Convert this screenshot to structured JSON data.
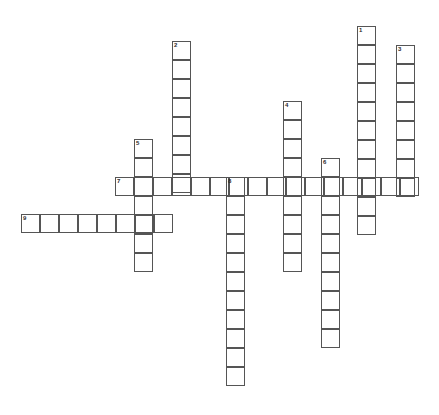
{
  "puzzle": {
    "type": "crossword-grid",
    "title": "Crossword Puzzle Grid",
    "width": 439,
    "height": 415,
    "cell_size": 19,
    "background_color": "#ffffff",
    "cell_border_color": "#555555",
    "number_color": "#2b2b2b",
    "origin_x": 21,
    "origin_y": 26,
    "numbered_clues": [
      "1",
      "2",
      "3",
      "4",
      "5",
      "6",
      "7",
      "8",
      "9"
    ],
    "entries": [
      {
        "number": "1",
        "direction": "down",
        "length": 11,
        "x": 357,
        "y": 26,
        "label": "entry-1-down"
      },
      {
        "number": "2",
        "direction": "down",
        "length": 8,
        "x": 172,
        "y": 41,
        "label": "entry-2-down"
      },
      {
        "number": "3",
        "direction": "down",
        "length": 8,
        "x": 396,
        "y": 45,
        "label": "entry-3-down"
      },
      {
        "number": "4",
        "direction": "down",
        "length": 9,
        "x": 283,
        "y": 101,
        "label": "entry-4-down"
      },
      {
        "number": "5",
        "direction": "down",
        "length": 7,
        "x": 134,
        "y": 139,
        "label": "entry-5-down"
      },
      {
        "number": "6",
        "direction": "down",
        "length": 10,
        "x": 321,
        "y": 158,
        "label": "entry-6-down"
      },
      {
        "number": "7",
        "direction": "across",
        "length": 16,
        "x": 115,
        "y": 177,
        "label": "entry-7-across"
      },
      {
        "number": "8",
        "direction": "down",
        "length": 11,
        "x": 226,
        "y": 177,
        "label": "entry-8-down"
      },
      {
        "number": "9",
        "direction": "across",
        "length": 8,
        "x": 21,
        "y": 214,
        "label": "entry-9-across"
      }
    ]
  }
}
